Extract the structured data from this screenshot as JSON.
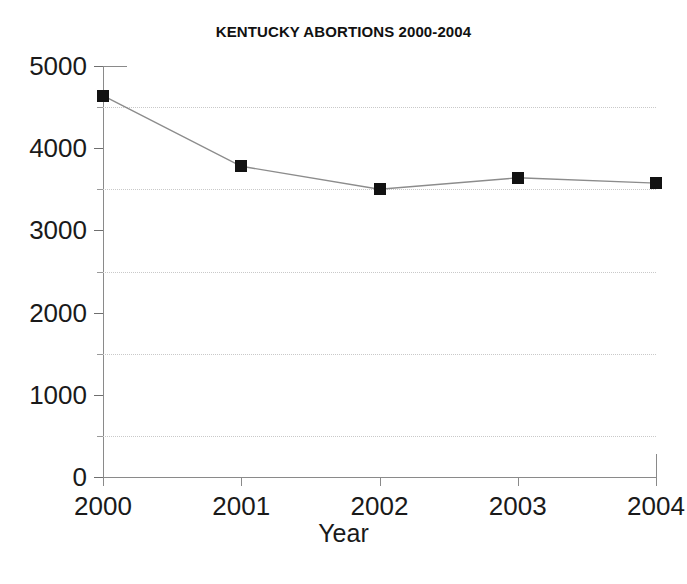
{
  "chart_data": {
    "type": "line",
    "title": "KENTUCKY ABORTIONS 2000-2004",
    "xlabel": "Year",
    "ylabel": "",
    "categories": [
      "2000",
      "2001",
      "2002",
      "2003",
      "2004"
    ],
    "x": [
      2000,
      2001,
      2002,
      2003,
      2004
    ],
    "values": [
      4640,
      3780,
      3500,
      3640,
      3575
    ],
    "series": [
      {
        "name": "Kentucky abortions",
        "values": [
          4640,
          3780,
          3500,
          3640,
          3575
        ]
      }
    ],
    "ylim": [
      0,
      5000
    ],
    "xlim": [
      2000,
      2004
    ],
    "y_ticks": [
      0,
      1000,
      2000,
      3000,
      4000,
      5000
    ],
    "y_tick_labels": [
      "0",
      "1000",
      "2000",
      "3000",
      "4000",
      "5000"
    ],
    "y_minor_ticks": [
      500,
      1500,
      2500,
      3500,
      4500
    ],
    "x_ticks": [
      2000,
      2001,
      2002,
      2003,
      2004
    ],
    "x_tick_labels": [
      "2000",
      "2001",
      "2002",
      "2003",
      "2004"
    ],
    "gridlines": {
      "visible": true,
      "axis": "y",
      "values": [
        500,
        1500,
        2500,
        3500,
        4500
      ],
      "style": "dotted",
      "color": "#c9c9c9"
    },
    "legend": {
      "visible": false,
      "position": "none",
      "entries": []
    },
    "marker": {
      "shape": "square",
      "color": "#121212",
      "size": 12
    },
    "line": {
      "color": "#8c8c8c",
      "width": 1.4
    },
    "axis_color": "#8a8a8a",
    "background": "#ffffff"
  }
}
